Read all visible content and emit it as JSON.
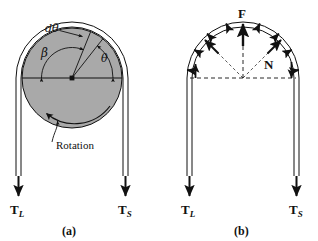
{
  "figure": {
    "caption_a": "(a)",
    "caption_b": "(b)",
    "background": "#ffffff",
    "stroke": "#111111",
    "pulley_fill": "#a9a9a9"
  },
  "panel_a": {
    "name": "pulley-with-rotation",
    "labels": {
      "d_theta": "dθ",
      "beta": "β",
      "theta": "θ",
      "rotation": "Rotation",
      "tension_left_symbol": "T",
      "tension_left_sub": "L",
      "tension_right_symbol": "T",
      "tension_right_sub": "S"
    },
    "geometry": {
      "center_x": 72,
      "center_y": 78,
      "radius": 50,
      "belt_left_x": 20,
      "belt_right_x": 124,
      "belt_bottom_y": 178,
      "theta_deg": 52,
      "dtheta_deg": 68,
      "beta_deg": 180
    }
  },
  "panel_b": {
    "name": "free-body-forces",
    "labels": {
      "resultant_force": "F",
      "normal_force": "N",
      "tension_left_symbol": "T",
      "tension_left_sub": "L",
      "tension_right_symbol": "T",
      "tension_right_sub": "S"
    },
    "geometry": {
      "center_x": 243,
      "center_y": 78,
      "radius": 50,
      "belt_left_x": 191,
      "belt_right_x": 295,
      "belt_bottom_y": 178,
      "normal_arrow_angles_deg": [
        8,
        30,
        52,
        74,
        96,
        118,
        140,
        164
      ],
      "long_arrow_angles_deg": [
        45,
        135
      ],
      "resultant_angle_deg": 90
    }
  }
}
